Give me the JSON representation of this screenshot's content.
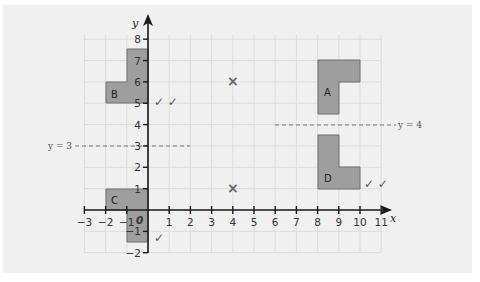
{
  "diagram": {
    "axes": {
      "x_label": "x",
      "y_label": "y",
      "x_ticks": [
        "−3",
        "−2",
        "−1",
        "1",
        "2",
        "3",
        "4",
        "5",
        "6",
        "7",
        "8",
        "9",
        "10",
        "11"
      ],
      "y_ticks": [
        "8",
        "7",
        "6",
        "5",
        "4",
        "3",
        "2",
        "1",
        "−1",
        "−2"
      ],
      "origin_label": "0"
    },
    "lines": {
      "y3_label": "y = 3",
      "y4_label": "y = 4"
    },
    "shapes": {
      "A": "A",
      "B": "B",
      "C": "C",
      "D": "D"
    },
    "marks": {
      "double_tick": "✓ ✓",
      "single_tick": "✓",
      "cross": "×"
    },
    "colors": {
      "shape_fill": "#9e9e9e",
      "shape_stroke": "#6e6e6e",
      "grid": "#dcdcdc",
      "panel": "#f0f0f0",
      "axis": "#1a1a1a"
    }
  },
  "chart_data": {
    "type": "scatter",
    "title": "",
    "xlabel": "x",
    "ylabel": "y",
    "xlim": [
      -3,
      11
    ],
    "ylim": [
      -2,
      8
    ],
    "grid": true,
    "shapes": [
      {
        "name": "A",
        "vertices": [
          [
            8,
            7
          ],
          [
            10,
            7
          ],
          [
            10,
            6
          ],
          [
            9,
            6
          ],
          [
            9,
            4.5
          ],
          [
            8,
            4.5
          ]
        ]
      },
      {
        "name": "B",
        "vertices": [
          [
            -1,
            7.5
          ],
          [
            0,
            7.5
          ],
          [
            0,
            5
          ],
          [
            -2,
            5
          ],
          [
            -2,
            6
          ],
          [
            -1,
            6
          ]
        ]
      },
      {
        "name": "C",
        "vertices": [
          [
            -2,
            1
          ],
          [
            0,
            1
          ],
          [
            0,
            -1.5
          ],
          [
            -1,
            -1.5
          ],
          [
            -1,
            0
          ],
          [
            -2,
            0
          ]
        ]
      },
      {
        "name": "D",
        "vertices": [
          [
            8,
            3.5
          ],
          [
            9,
            3.5
          ],
          [
            9,
            2
          ],
          [
            10,
            2
          ],
          [
            10,
            1
          ],
          [
            8,
            1
          ]
        ]
      }
    ],
    "lines": [
      {
        "name": "y = 3",
        "y": 3,
        "x_range": [
          -5.3,
          2
        ],
        "style": "dashed"
      },
      {
        "name": "y = 4",
        "y": 4,
        "x_range": [
          6,
          11.8
        ],
        "style": "dashed"
      }
    ],
    "points": [
      {
        "x": 4,
        "y": 6,
        "marker": "x"
      },
      {
        "x": 4,
        "y": 1,
        "marker": "x"
      }
    ],
    "annotations": [
      {
        "text": "✓✓",
        "near": "B"
      },
      {
        "text": "✓✓",
        "near": "D"
      },
      {
        "text": "✓",
        "near": "C"
      }
    ]
  }
}
